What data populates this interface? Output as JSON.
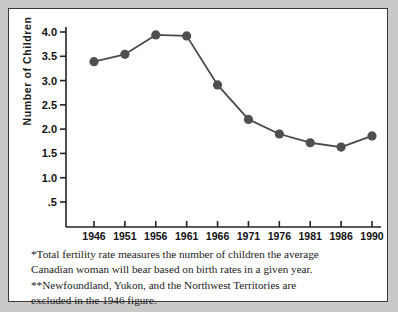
{
  "chart_data": {
    "type": "line",
    "title": "",
    "xlabel": "",
    "ylabel": "Number of Children",
    "categories": [
      "1946",
      "1951",
      "1956",
      "1961",
      "1966",
      "1971",
      "1976",
      "1981",
      "1986",
      "1990"
    ],
    "x": [
      1946,
      1951,
      1956,
      1961,
      1966,
      1971,
      1976,
      1981,
      1986,
      1990
    ],
    "values": [
      3.39,
      3.54,
      3.94,
      3.92,
      2.91,
      2.2,
      1.9,
      1.72,
      1.63,
      1.86
    ],
    "series": [
      {
        "name": "Total fertility rate",
        "values": [
          3.39,
          3.54,
          3.94,
          3.92,
          2.91,
          2.2,
          1.9,
          1.72,
          1.63,
          1.86
        ]
      }
    ],
    "ylim": [
      0,
      4.25
    ],
    "yticks": [
      0.5,
      1.0,
      1.5,
      2.0,
      2.5,
      3.0,
      3.5,
      4.0
    ],
    "ytick_labels": [
      ".5",
      "1.0",
      "1.5",
      "2.0",
      "2.5",
      "3.0",
      "3.5",
      "4.0"
    ],
    "grid": false,
    "legend": "none",
    "marker": "filled-circle",
    "line_color": "#4a4a4a",
    "marker_color": "#4f4f4f"
  },
  "axis": {
    "y_title": "Number of Children"
  },
  "caption": {
    "line1": "*Total fertility rate measures the number of children the average",
    "line2": "Canadian woman will bear based on birth rates in a given year.",
    "line3": "**Newfoundland, Yukon, and the Northwest Territories are",
    "line4": "excluded in the 1946 figure."
  },
  "colors": {
    "page_background": "#c9c9c7",
    "figure_background": "#ffffff",
    "frame_border": "#3a3a3a",
    "axis": "#222222",
    "text": "#111111"
  }
}
